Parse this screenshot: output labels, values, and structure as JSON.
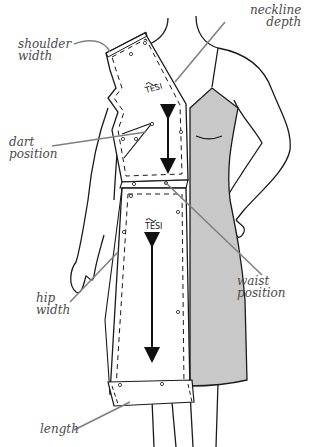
{
  "diagram": {
    "colors": {
      "outline": "#1a1a1a",
      "dress_fill": "#c8c8c8",
      "leader_line": "#808080",
      "label_text": "#4a4a4a",
      "background": "#ffffff"
    },
    "labels": {
      "shoulder_width": {
        "line1": "shoulder",
        "line2": "width"
      },
      "neckline_depth": {
        "line1": "neckline",
        "line2": "depth"
      },
      "dart_position": {
        "line1": "dart",
        "line2": "position"
      },
      "waist_position": {
        "line1": "waist",
        "line2": "position"
      },
      "hip_width": {
        "line1": "hip",
        "line2": "width"
      },
      "length": {
        "line1": "length"
      }
    },
    "pattern_pieces": [
      {
        "name": "bodice",
        "grainline_marker": "TESI",
        "arrow": "double-headed vertical"
      },
      {
        "name": "skirt",
        "grainline_marker": "TESI",
        "arrow": "double-headed vertical"
      }
    ]
  }
}
